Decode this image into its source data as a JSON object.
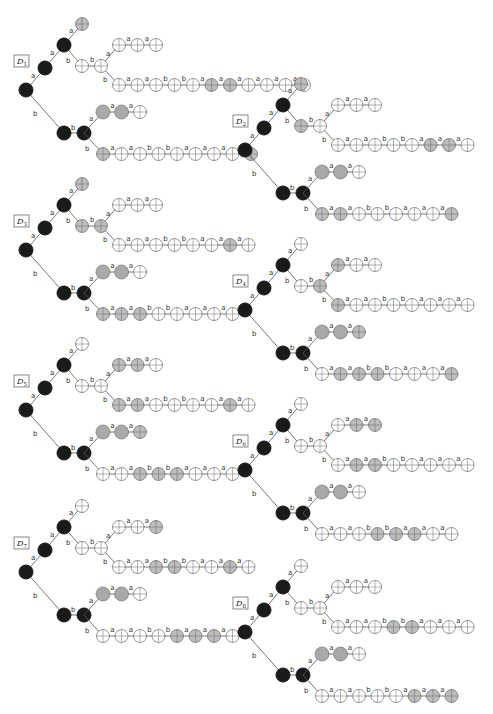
{
  "figure": {
    "node_legend": {
      "black": "#1a1a1a",
      "gray": "#a9a9a9",
      "white_cross": "#ffffff",
      "gray_cross": "#bdbdbd"
    },
    "trees": [
      {
        "id": "D1",
        "label": "D",
        "sub": "1",
        "origin": [
          26,
          90
        ],
        "top_leaf": "gray_x",
        "upper_first": [
          "white_x",
          "white_x"
        ],
        "upper_short": [
          "white_x",
          "white_x",
          "white_x"
        ],
        "upper_long": [
          "white_x",
          "white_x",
          "white_x",
          "white_x",
          "white_x",
          "gray_x",
          "gray_x",
          "white_x",
          "white_x",
          "white_x",
          "white_x"
        ],
        "upper_long_labels": [
          "a",
          "a",
          "b",
          "b",
          "a",
          "a",
          "a",
          "a",
          "a",
          "a"
        ],
        "lower_short": [
          "gray",
          "gray",
          "white_x"
        ],
        "lower_long": [
          "gray_x",
          "white_x",
          "white_x",
          "white_x",
          "white_x",
          "white_x",
          "white_x",
          "white_x",
          "gray_x"
        ],
        "lower_long_labels": [
          "a",
          "a",
          "b",
          "b",
          "a",
          "a",
          "a"
        ]
      },
      {
        "id": "D2",
        "label": "D",
        "sub": "2",
        "origin": [
          245,
          150
        ],
        "top_leaf": "gray_x",
        "upper_first": [
          "gray_x",
          "white_x"
        ],
        "upper_short": [
          "white_x",
          "white_x",
          "white_x"
        ],
        "upper_long": [
          "white_x",
          "white_x",
          "white_x",
          "white_x",
          "white_x",
          "gray_x",
          "gray_x",
          "white_x"
        ],
        "upper_long_labels": [
          "a",
          "a",
          "b",
          "b",
          "a",
          "a",
          "a"
        ],
        "lower_short": [
          "gray",
          "gray",
          "white_x"
        ],
        "lower_long": [
          "gray_x",
          "gray_x",
          "white_x",
          "white_x",
          "white_x",
          "white_x",
          "white_x",
          "gray_x"
        ],
        "lower_long_labels": [
          "a",
          "a",
          "b",
          "b",
          "a",
          "a",
          "a"
        ]
      },
      {
        "id": "D3",
        "label": "D",
        "sub": "3",
        "origin": [
          26,
          250
        ],
        "top_leaf": "gray_x",
        "upper_first": [
          "gray_x",
          "gray_x"
        ],
        "upper_short": [
          "white_x",
          "white_x",
          "white_x"
        ],
        "upper_long": [
          "white_x",
          "white_x",
          "white_x",
          "white_x",
          "white_x",
          "white_x",
          "gray_x",
          "white_x"
        ],
        "upper_long_labels": [
          "a",
          "a",
          "b",
          "b",
          "a",
          "a",
          "a"
        ],
        "lower_short": [
          "gray",
          "gray",
          "white_x"
        ],
        "lower_long": [
          "gray_x",
          "gray_x",
          "gray_x",
          "white_x",
          "white_x",
          "white_x",
          "white_x",
          "white_x"
        ],
        "lower_long_labels": [
          "a",
          "a",
          "b",
          "b",
          "a",
          "a",
          "a"
        ]
      },
      {
        "id": "D4",
        "label": "D",
        "sub": "4",
        "origin": [
          245,
          310
        ],
        "top_leaf": "white_x",
        "upper_first": [
          "white_x",
          "gray_x"
        ],
        "upper_short": [
          "gray_x",
          "white_x",
          "white_x"
        ],
        "upper_long": [
          "gray_x",
          "white_x",
          "white_x",
          "white_x",
          "white_x",
          "white_x",
          "white_x",
          "white_x"
        ],
        "upper_long_labels": [
          "a",
          "a",
          "b",
          "b",
          "a",
          "a",
          "a"
        ],
        "lower_short": [
          "gray",
          "gray",
          "gray_x"
        ],
        "lower_long": [
          "white_x",
          "gray_x",
          "gray_x",
          "gray_x",
          "white_x",
          "white_x",
          "white_x",
          "gray_x"
        ],
        "lower_long_labels": [
          "a",
          "a",
          "b",
          "b",
          "a",
          "a",
          "a"
        ]
      },
      {
        "id": "D5",
        "label": "D",
        "sub": "5",
        "origin": [
          26,
          410
        ],
        "top_leaf": "white_x",
        "upper_first": [
          "white_x",
          "white_x"
        ],
        "upper_short": [
          "gray_x",
          "gray_x",
          "white_x"
        ],
        "upper_long": [
          "gray_x",
          "gray_x",
          "white_x",
          "white_x",
          "white_x",
          "white_x",
          "gray_x",
          "white_x"
        ],
        "upper_long_labels": [
          "a",
          "a",
          "b",
          "b",
          "a",
          "a",
          "a"
        ],
        "lower_short": [
          "gray",
          "gray",
          "gray_x"
        ],
        "lower_long": [
          "white_x",
          "white_x",
          "gray_x",
          "gray_x",
          "gray_x",
          "white_x",
          "white_x",
          "white_x"
        ],
        "lower_long_labels": [
          "a",
          "a",
          "b",
          "b",
          "a",
          "a",
          "a"
        ]
      },
      {
        "id": "D6",
        "label": "D",
        "sub": "6",
        "origin": [
          245,
          470
        ],
        "top_leaf": "white_x",
        "upper_first": [
          "white_x",
          "white_x"
        ],
        "upper_short": [
          "white_x",
          "gray_x",
          "gray_x"
        ],
        "upper_long": [
          "white_x",
          "gray_x",
          "gray_x",
          "white_x",
          "white_x",
          "white_x",
          "white_x",
          "white_x"
        ],
        "upper_long_labels": [
          "a",
          "a",
          "b",
          "b",
          "a",
          "a",
          "a"
        ],
        "lower_short": [
          "gray",
          "gray",
          "white_x"
        ],
        "lower_long": [
          "white_x",
          "white_x",
          "white_x",
          "gray_x",
          "gray_x",
          "gray_x",
          "white_x",
          "white_x"
        ],
        "lower_long_labels": [
          "a",
          "a",
          "b",
          "b",
          "a",
          "a",
          "a"
        ]
      },
      {
        "id": "D7",
        "label": "D",
        "sub": "7",
        "origin": [
          26,
          572
        ],
        "top_leaf": "white_x",
        "upper_first": [
          "white_x",
          "white_x"
        ],
        "upper_short": [
          "white_x",
          "white_x",
          "gray_x"
        ],
        "upper_long": [
          "white_x",
          "white_x",
          "gray_x",
          "gray_x",
          "white_x",
          "white_x",
          "gray_x",
          "white_x"
        ],
        "upper_long_labels": [
          "a",
          "a",
          "b",
          "b",
          "a",
          "a",
          "a"
        ],
        "lower_short": [
          "gray",
          "gray",
          "white_x"
        ],
        "lower_long": [
          "white_x",
          "white_x",
          "white_x",
          "white_x",
          "gray_x",
          "gray_x",
          "gray_x",
          "white_x"
        ],
        "lower_long_labels": [
          "a",
          "a",
          "b",
          "b",
          "a",
          "a",
          "a"
        ]
      },
      {
        "id": "D8",
        "label": "D",
        "sub": "8",
        "origin": [
          245,
          632
        ],
        "top_leaf": "white_x",
        "upper_first": [
          "white_x",
          "white_x"
        ],
        "upper_short": [
          "white_x",
          "white_x",
          "white_x"
        ],
        "upper_long": [
          "white_x",
          "white_x",
          "white_x",
          "gray_x",
          "gray_x",
          "white_x",
          "white_x",
          "white_x"
        ],
        "upper_long_labels": [
          "a",
          "a",
          "b",
          "b",
          "a",
          "a",
          "a"
        ],
        "lower_short": [
          "gray",
          "gray",
          "white_x"
        ],
        "lower_long": [
          "white_x",
          "white_x",
          "white_x",
          "white_x",
          "white_x",
          "gray_x",
          "gray_x",
          "gray_x"
        ],
        "lower_long_labels": [
          "a",
          "a",
          "b",
          "b",
          "a",
          "a",
          "a"
        ]
      }
    ]
  }
}
